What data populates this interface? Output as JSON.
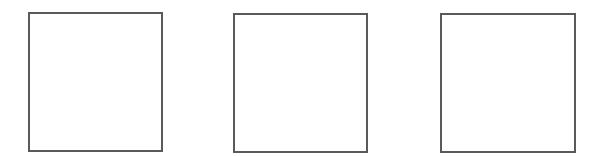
{
  "canvas": {
    "width": 605,
    "height": 156,
    "background": "#ffffff"
  },
  "boxes": [
    {
      "id": "box-1",
      "x": 28,
      "y": 12,
      "width": 135,
      "height": 140,
      "border_color": "#5a5a5a",
      "border_width": 2,
      "fill": "#ffffff",
      "label": ""
    },
    {
      "id": "box-2",
      "x": 233,
      "y": 13,
      "width": 135,
      "height": 140,
      "border_color": "#5a5a5a",
      "border_width": 2,
      "fill": "#ffffff",
      "label": ""
    },
    {
      "id": "box-3",
      "x": 440,
      "y": 13,
      "width": 136,
      "height": 140,
      "border_color": "#5a5a5a",
      "border_width": 2,
      "fill": "#ffffff",
      "label": ""
    }
  ]
}
